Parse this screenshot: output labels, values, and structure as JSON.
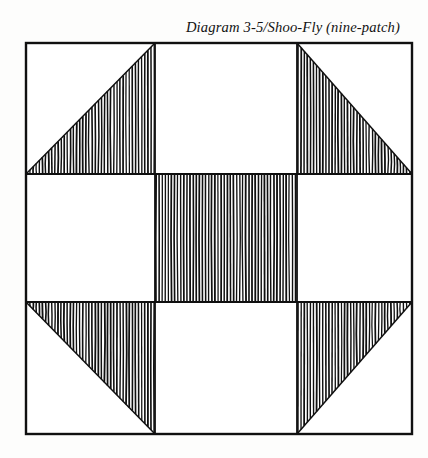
{
  "caption": {
    "text": "Diagram 3-5/Shoo-Fly (nine-patch)",
    "label": "Diagram 3-5",
    "pattern_name": "Shoo-Fly",
    "pattern_type": "nine-patch"
  },
  "figure": {
    "name": "shoo-fly-quilt-block",
    "grid_rows": 3,
    "grid_cols": 3,
    "ink_color": "#101010",
    "paper_color": "#fdfdfc",
    "fill_color": "#ffffff",
    "frame": {
      "x": 26,
      "y": 43,
      "width": 386,
      "height": 391,
      "stroke_width": 2.4
    },
    "grid": {
      "vertical_lines": [
        155,
        297
      ],
      "horizontal_lines": [
        174,
        302
      ],
      "stroke_width": 1.8
    },
    "hatching": {
      "orientation": "vertical",
      "spacing": 3.1,
      "stroke_width": 1.45,
      "waviness": 1.0
    },
    "patches": [
      {
        "row": 0,
        "col": 0,
        "name": "patch-top-left",
        "type": "half-square-triangle",
        "shaded_half": "lower-right"
      },
      {
        "row": 0,
        "col": 1,
        "name": "patch-top-center",
        "type": "plain-square",
        "shaded_half": "none"
      },
      {
        "row": 0,
        "col": 2,
        "name": "patch-top-right",
        "type": "half-square-triangle",
        "shaded_half": "lower-left"
      },
      {
        "row": 1,
        "col": 0,
        "name": "patch-middle-left",
        "type": "plain-square",
        "shaded_half": "none"
      },
      {
        "row": 1,
        "col": 1,
        "name": "patch-center",
        "type": "filled-square",
        "shaded_half": "all"
      },
      {
        "row": 1,
        "col": 2,
        "name": "patch-middle-right",
        "type": "plain-square",
        "shaded_half": "none"
      },
      {
        "row": 2,
        "col": 0,
        "name": "patch-bottom-left",
        "type": "half-square-triangle",
        "shaded_half": "upper-right"
      },
      {
        "row": 2,
        "col": 1,
        "name": "patch-bottom-center",
        "type": "plain-square",
        "shaded_half": "none"
      },
      {
        "row": 2,
        "col": 2,
        "name": "patch-bottom-right",
        "type": "half-square-triangle",
        "shaded_half": "upper-left"
      }
    ]
  }
}
